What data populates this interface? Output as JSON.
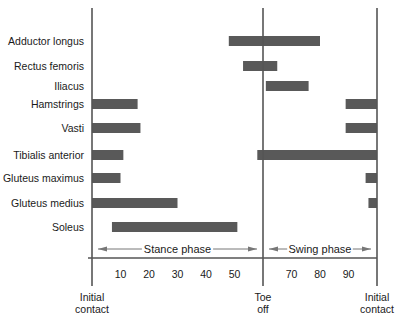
{
  "chart_data": {
    "type": "bar",
    "subtype": "horizontal-range (timeline) bars",
    "title": "",
    "xlabel": "",
    "ylabel": "",
    "xlim": [
      0,
      100
    ],
    "x_ticks": [
      10,
      20,
      30,
      40,
      50,
      70,
      80,
      90
    ],
    "toe_off_percent": 60,
    "grid": false,
    "legend": null,
    "bar_color": "#595959",
    "phases": [
      {
        "label": "Stance phase",
        "start": 0,
        "end": 60
      },
      {
        "label": "Swing phase",
        "start": 60,
        "end": 100
      }
    ],
    "events": [
      {
        "label_line1": "Initial",
        "label_line2": "contact",
        "x": 0
      },
      {
        "label_line1": "Toe",
        "label_line2": "off",
        "x": 60
      },
      {
        "label_line1": "Initial",
        "label_line2": "contact",
        "x": 100
      }
    ],
    "categories": [
      "Adductor longus",
      "Rectus femoris",
      "Iliacus",
      "Hamstrings",
      "Vasti",
      "Tibialis anterior",
      "Gluteus maximus",
      "Gluteus medius",
      "Soleus"
    ],
    "series": [
      {
        "name": "Adductor longus",
        "ranges": [
          [
            48,
            80
          ]
        ]
      },
      {
        "name": "Rectus femoris",
        "ranges": [
          [
            53,
            65
          ]
        ]
      },
      {
        "name": "Iliacus",
        "ranges": [
          [
            61,
            76
          ]
        ]
      },
      {
        "name": "Hamstrings",
        "ranges": [
          [
            0,
            16
          ],
          [
            89,
            100
          ]
        ]
      },
      {
        "name": "Vasti",
        "ranges": [
          [
            0,
            17
          ],
          [
            89,
            100
          ]
        ]
      },
      {
        "name": "Tibialis anterior",
        "ranges": [
          [
            0,
            11
          ],
          [
            58,
            100
          ]
        ]
      },
      {
        "name": "Gluteus maximus",
        "ranges": [
          [
            0,
            10
          ],
          [
            96,
            100
          ]
        ]
      },
      {
        "name": "Gluteus medius",
        "ranges": [
          [
            0,
            30
          ],
          [
            97,
            100
          ]
        ]
      },
      {
        "name": "Soleus",
        "ranges": [
          [
            7,
            51
          ]
        ]
      }
    ]
  }
}
